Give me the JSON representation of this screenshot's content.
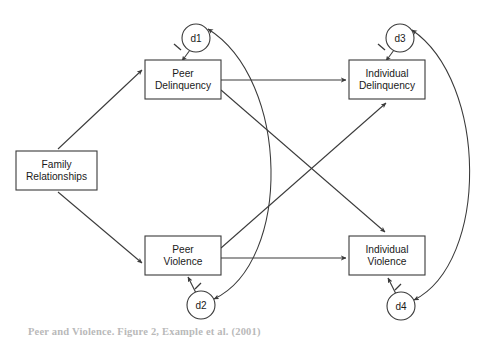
{
  "figure": {
    "type": "path-diagram",
    "caption": "Peer and Violence.  Figure 2, Example et al. (2001)",
    "stroke_color": "#3a3a3a",
    "background_color": "#ffffff",
    "text_color": "#1a1a1a"
  },
  "nodes": {
    "boxes": [
      {
        "id": "family_relationships",
        "lines": [
          "Family",
          "Relationships"
        ],
        "x": 16,
        "y": 151,
        "w": 81,
        "h": 39
      },
      {
        "id": "peer_delinquency",
        "lines": [
          "Peer",
          "Delinquency"
        ],
        "x": 145,
        "y": 60,
        "w": 76,
        "h": 39
      },
      {
        "id": "peer_violence",
        "lines": [
          "Peer",
          "Violence"
        ],
        "x": 145,
        "y": 236,
        "w": 76,
        "h": 39
      },
      {
        "id": "individual_delinquency",
        "lines": [
          "Individual",
          "Delinquency"
        ],
        "x": 349,
        "y": 60,
        "w": 76,
        "h": 39
      },
      {
        "id": "individual_violence",
        "lines": [
          "Individual",
          "Violence"
        ],
        "x": 349,
        "y": 236,
        "w": 76,
        "h": 39
      }
    ],
    "circles": [
      {
        "id": "d1",
        "label": "d1",
        "cx": 196,
        "cy": 38,
        "r": 14
      },
      {
        "id": "d3",
        "label": "d3",
        "cx": 400,
        "cy": 38,
        "r": 14
      },
      {
        "id": "d2",
        "label": "d2",
        "cx": 201,
        "cy": 305,
        "r": 14
      },
      {
        "id": "d4",
        "label": "d4",
        "cx": 401,
        "cy": 306,
        "r": 14
      }
    ]
  },
  "edges": {
    "directed": [
      {
        "id": "family-to-peer-delinquency",
        "from": "family_relationships",
        "to": "peer_delinquency"
      },
      {
        "id": "family-to-peer-violence",
        "from": "family_relationships",
        "to": "peer_violence"
      },
      {
        "id": "peer-delinquency-to-individual-delinquency",
        "from": "peer_delinquency",
        "to": "individual_delinquency"
      },
      {
        "id": "peer-violence-to-individual-violence",
        "from": "peer_violence",
        "to": "individual_violence"
      },
      {
        "id": "peer-delinquency-to-individual-violence",
        "from": "peer_delinquency",
        "to": "individual_violence"
      },
      {
        "id": "peer-violence-to-individual-delinquency",
        "from": "peer_violence",
        "to": "individual_delinquency"
      },
      {
        "id": "d1-to-peer-delinquency",
        "from": "d1",
        "to": "peer_delinquency",
        "fixed_value": "1"
      },
      {
        "id": "d2-to-peer-violence",
        "from": "d2",
        "to": "peer_violence",
        "fixed_value": "1"
      },
      {
        "id": "d3-to-individual-delinquency",
        "from": "d3",
        "to": "individual_delinquency",
        "fixed_value": "1"
      },
      {
        "id": "d4-to-individual-violence",
        "from": "d4",
        "to": "individual_violence",
        "fixed_value": "1"
      }
    ],
    "covariances": [
      {
        "id": "d1-d2-covariance",
        "between": [
          "d1",
          "d2"
        ],
        "style": "double-headed-curve"
      },
      {
        "id": "d3-d4-covariance",
        "between": [
          "d3",
          "d4"
        ],
        "style": "double-headed-curve"
      }
    ]
  }
}
